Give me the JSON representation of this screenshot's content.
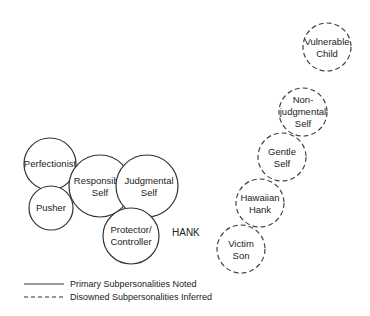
{
  "diagram": {
    "subject_label": "HANK",
    "primary_subpersonalities": [
      {
        "id": "perfectionist",
        "line1": "Perfectionist",
        "line2": "",
        "cx": 50,
        "cy": 164,
        "r": 26
      },
      {
        "id": "pusher",
        "line1": "Pusher",
        "line2": "",
        "cx": 51,
        "cy": 208,
        "r": 22
      },
      {
        "id": "responsible-self",
        "line1": "Responsible",
        "line2": "Self",
        "cx": 100,
        "cy": 186,
        "r": 31
      },
      {
        "id": "judgmental-self",
        "line1": "Judgmental",
        "line2": "Self",
        "cx": 147,
        "cy": 186,
        "r": 31
      },
      {
        "id": "protector-controller",
        "line1": "Protector/",
        "line2": "Controller",
        "cx": 131,
        "cy": 236,
        "r": 28
      }
    ],
    "disowned_subpersonalities": [
      {
        "id": "vulnerable-child",
        "line1": "Vulnerable",
        "line2": "Child",
        "line3": "",
        "cx": 327,
        "cy": 47,
        "r": 24
      },
      {
        "id": "non-judgmental-self",
        "line1": "Non-",
        "line2": "judgmental",
        "line3": "Self",
        "cx": 303,
        "cy": 112,
        "r": 24
      },
      {
        "id": "gentle-self",
        "line1": "Gentle",
        "line2": "Self",
        "line3": "",
        "cx": 282,
        "cy": 157,
        "r": 24
      },
      {
        "id": "hawaiian-hank",
        "line1": "Hawaiian",
        "line2": "Hank",
        "line3": "",
        "cx": 260,
        "cy": 203,
        "r": 24
      },
      {
        "id": "victim-son",
        "line1": "Victim",
        "line2": "Son",
        "line3": "",
        "cx": 241,
        "cy": 249,
        "r": 24
      }
    ],
    "legend": {
      "solid_label": "Primary Subpersonalities Noted",
      "dashed_label": "Disowned Subpersonalities Inferred"
    }
  }
}
